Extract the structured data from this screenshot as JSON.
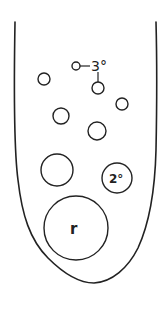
{
  "diagram": {
    "stroke_color": "#222222",
    "background": "#ffffff",
    "outline": {
      "shape": "u-tube"
    },
    "labels": {
      "tertiary": "3°",
      "secondary": "2°",
      "primary": "r"
    },
    "circles": [
      {
        "id": "tertiary-bud",
        "cx": 76,
        "cy": 66,
        "r": 4
      },
      {
        "id": "tertiary-child",
        "cx": 98,
        "cy": 88,
        "r": 6
      },
      {
        "id": "small-1",
        "cx": 44,
        "cy": 79,
        "r": 6
      },
      {
        "id": "small-2",
        "cx": 122,
        "cy": 104,
        "r": 6
      },
      {
        "id": "medium-1",
        "cx": 61,
        "cy": 116,
        "r": 8
      },
      {
        "id": "medium-2",
        "cx": 97,
        "cy": 131,
        "r": 9
      },
      {
        "id": "large-1",
        "cx": 57,
        "cy": 170,
        "r": 16
      },
      {
        "id": "secondary",
        "cx": 117,
        "cy": 178,
        "r": 15
      },
      {
        "id": "primary",
        "cx": 76,
        "cy": 228,
        "r": 32
      }
    ]
  }
}
